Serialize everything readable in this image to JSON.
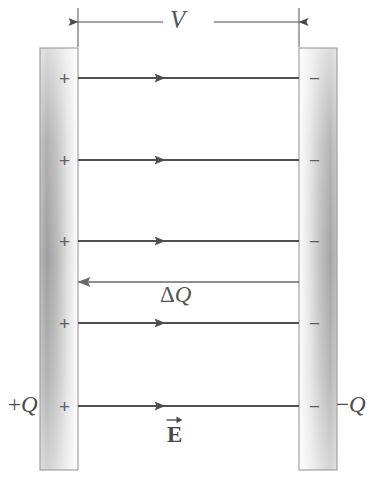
{
  "figure": {
    "type": "physics-diagram",
    "labels": {
      "voltage": "V",
      "delta_charge_delta": "Δ",
      "delta_charge_q": "Q",
      "field_symbol": "E",
      "left_plate_charge_sign": "+",
      "left_plate_charge_q": "Q",
      "right_plate_charge_sign": "−",
      "right_plate_charge_q": "Q"
    },
    "left_plate": {
      "name": "positive-plate",
      "charge_label": "+Q",
      "signs": [
        "+",
        "+",
        "+",
        "+",
        "+"
      ],
      "sign_y": [
        78,
        160,
        241,
        323,
        406
      ],
      "x": 40,
      "y": 48,
      "width": 38,
      "height": 422,
      "gradient": [
        "#7d7d7d",
        "#ffffff"
      ],
      "gradient_direction": "left-dark-to-right-light",
      "border_color": "#9a9a9a"
    },
    "right_plate": {
      "name": "negative-plate",
      "charge_label": "−Q",
      "signs": [
        "−",
        "−",
        "−",
        "−",
        "−"
      ],
      "sign_y": [
        78,
        160,
        241,
        323,
        406
      ],
      "x": 299,
      "y": 48,
      "width": 38,
      "height": 422,
      "gradient": [
        "#ffffff",
        "#7d7d7d"
      ],
      "gradient_direction": "left-light-to-right-dark",
      "border_color": "#9a9a9a"
    },
    "field_lines": [
      {
        "name": "field-line-1",
        "y": 78,
        "direction": "right",
        "label": ""
      },
      {
        "name": "field-line-2",
        "y": 160,
        "direction": "right",
        "label": ""
      },
      {
        "name": "field-line-3",
        "y": 241,
        "direction": "right",
        "label": ""
      },
      {
        "name": "charge-transfer-line",
        "y": 282,
        "direction": "left",
        "label": "ΔQ"
      },
      {
        "name": "field-line-4",
        "y": 323,
        "direction": "right",
        "label": ""
      },
      {
        "name": "field-line-5",
        "y": 406,
        "direction": "right",
        "label": "E"
      }
    ],
    "dimension": {
      "name": "voltage-dimension",
      "label": "V",
      "x_start": 78,
      "x_end": 299,
      "y": 22,
      "tick_top": 8,
      "tick_bottom": 47,
      "style": "double-headed-arrow"
    },
    "colors": {
      "line": "#4f4f4f",
      "plate_dark": "#7d7d7d",
      "plate_light": "#ffffff",
      "text": "#4a4a4a",
      "background": "#ffffff"
    }
  }
}
